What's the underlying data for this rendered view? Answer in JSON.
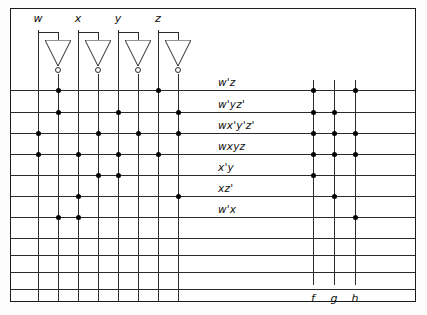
{
  "diagram": {
    "type": "pla-diagram",
    "colors": {
      "line": "#2b2b2b",
      "dot": "#000000",
      "background": "#ffffff",
      "border": "#1a1a1a"
    }
  },
  "inputs": {
    "labels": [
      "w",
      "x",
      "y",
      "z"
    ],
    "lines": [
      {
        "name": "w",
        "x": 38,
        "inverted": false
      },
      {
        "name": "w'",
        "x": 58,
        "inverted": true
      },
      {
        "name": "x",
        "x": 78,
        "inverted": false
      },
      {
        "name": "x'",
        "x": 98,
        "inverted": true
      },
      {
        "name": "y",
        "x": 118,
        "inverted": false
      },
      {
        "name": "y'",
        "x": 138,
        "inverted": true
      },
      {
        "name": "z",
        "x": 158,
        "inverted": false
      },
      {
        "name": "z'",
        "x": 178,
        "inverted": true
      }
    ],
    "inverters": [
      {
        "for": "w",
        "in_x": 38,
        "out_x": 58
      },
      {
        "for": "x",
        "in_x": 78,
        "out_x": 98
      },
      {
        "for": "y",
        "in_x": 118,
        "out_x": 138
      },
      {
        "for": "z",
        "in_x": 158,
        "out_x": 178
      }
    ]
  },
  "product_terms": [
    {
      "label": "w'z",
      "y": 90,
      "and_dots": [
        "w'",
        "z"
      ]
    },
    {
      "label": "w'yz'",
      "y": 112,
      "and_dots": [
        "w'",
        "y",
        "z'"
      ]
    },
    {
      "label": "wx'y'z'",
      "y": 133,
      "and_dots": [
        "w",
        "x'",
        "y'",
        "z'"
      ]
    },
    {
      "label": "wxyz",
      "y": 154,
      "and_dots": [
        "w",
        "x",
        "y",
        "z"
      ]
    },
    {
      "label": "x'y",
      "y": 175,
      "and_dots": [
        "x'",
        "y"
      ]
    },
    {
      "label": "xz'",
      "y": 196,
      "and_dots": [
        "x",
        "z'"
      ]
    },
    {
      "label": "w'x",
      "y": 217,
      "and_dots": [
        "w'",
        "x"
      ]
    },
    {
      "label": "",
      "y": 238,
      "and_dots": []
    },
    {
      "label": "",
      "y": 255,
      "and_dots": []
    },
    {
      "label": "",
      "y": 272,
      "and_dots": []
    },
    {
      "label": "",
      "y": 289,
      "and_dots": []
    }
  ],
  "outputs": {
    "labels": [
      "f",
      "g",
      "h"
    ],
    "lines": [
      {
        "name": "f",
        "x": 313
      },
      {
        "name": "g",
        "x": 334
      },
      {
        "name": "h",
        "x": 355
      }
    ],
    "label_y": 292
  },
  "or_plane_dots": [
    {
      "term": "w'z",
      "outputs": [
        "f",
        "h"
      ]
    },
    {
      "term": "w'yz'",
      "outputs": [
        "f",
        "g"
      ]
    },
    {
      "term": "wx'y'z'",
      "outputs": [
        "f",
        "g",
        "h"
      ]
    },
    {
      "term": "wxyz",
      "outputs": [
        "f",
        "g",
        "h"
      ]
    },
    {
      "term": "x'y",
      "outputs": [
        "f"
      ]
    },
    {
      "term": "xz'",
      "outputs": [
        "g"
      ]
    },
    {
      "term": "w'x",
      "outputs": [
        "h"
      ]
    }
  ],
  "geometry": {
    "frame": {
      "left": 10,
      "top": 8,
      "width": 406,
      "height": 294
    },
    "row_left": 11,
    "row_right": 415,
    "col_top": 30,
    "col_bottom": 301,
    "out_col_top": 80,
    "out_col_bottom": 285,
    "label_x": 218,
    "input_label_y": 12,
    "inverter_tap_y": 32,
    "inverter_top_y": 40,
    "inverter_bottom_y": 66,
    "inverter_half_width": 13
  }
}
